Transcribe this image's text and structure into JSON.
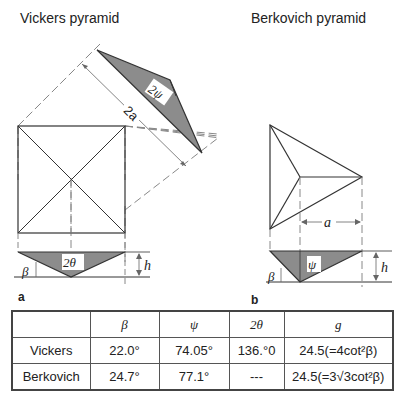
{
  "titles": {
    "vickers": "Vickers pyramid",
    "berkovich": "Berkovich pyramid"
  },
  "panel_labels": {
    "a": "a",
    "b": "b"
  },
  "diagram_labels": {
    "two_psi": "2ψ",
    "two_a": "2a",
    "two_theta": "2θ",
    "beta": "β",
    "h": "h",
    "a": "a",
    "psi": "ψ"
  },
  "table": {
    "headers": [
      "",
      "β",
      "ψ",
      "2θ",
      "g"
    ],
    "rows": [
      {
        "name": "Vickers",
        "beta": "22.0°",
        "psi": "74.05°",
        "two_theta": "136.°0",
        "g": "24.5(=4cot²β)"
      },
      {
        "name": "Berkovich",
        "beta": "24.7°",
        "psi": "77.1°",
        "two_theta": "---",
        "g": "24.5(=3√3cot²β)"
      }
    ]
  },
  "colors": {
    "fill_gray": "#8c8c8c",
    "line": "#333333",
    "dashed": "#888888"
  }
}
